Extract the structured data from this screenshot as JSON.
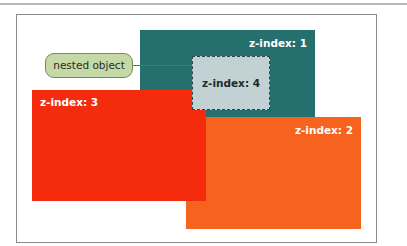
{
  "diagram": {
    "callout": {
      "label": "nested object"
    },
    "boxes": [
      {
        "id": "z1",
        "label": "z-index: 1",
        "color": "#256f6f"
      },
      {
        "id": "z2",
        "label": "z-index: 2",
        "color": "#f5631e"
      },
      {
        "id": "z3",
        "label": "z-index: 3",
        "color": "#f52b0d"
      },
      {
        "id": "z4",
        "label": "z-index: 4",
        "color": "#c2d2d4",
        "style": "dashed nested"
      }
    ]
  }
}
